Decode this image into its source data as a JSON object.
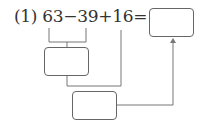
{
  "problem": {
    "label": "(1)",
    "expression": "63−39+16=",
    "terms": [
      "63",
      "39",
      "16"
    ],
    "operators": [
      "−",
      "+",
      "="
    ]
  },
  "boxes": {
    "answer": "",
    "step1": "",
    "step2": ""
  }
}
